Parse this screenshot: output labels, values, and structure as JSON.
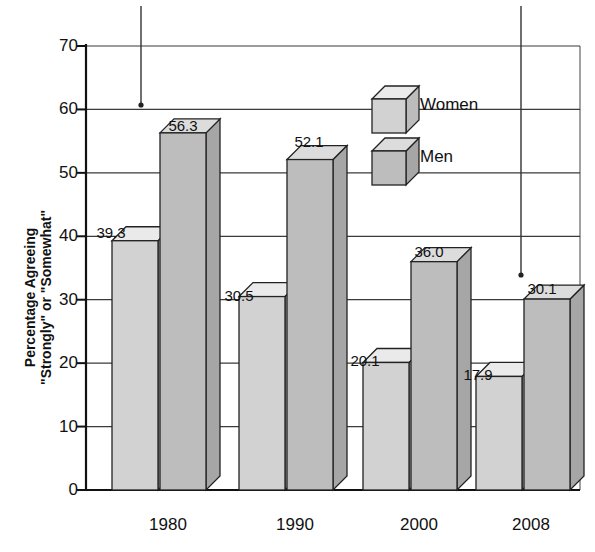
{
  "chart_data": {
    "type": "bar",
    "title": "",
    "subtitle": "",
    "xlabel": "",
    "ylabel": "Percentage Agreeing \"Strongly\" or \"Somewhat\"",
    "ylabel_lines": [
      "Percentage Agreeing",
      "\"Strongly\" or \"Somewhat\""
    ],
    "categories": [
      "1980",
      "1990",
      "2000",
      "2008"
    ],
    "series": [
      {
        "name": "Women",
        "color": "#d2d2d2",
        "values": [
          39.3,
          30.5,
          20.1,
          17.9
        ],
        "labels": [
          "39.3",
          "30.5",
          "20.1",
          "17.9"
        ]
      },
      {
        "name": "Men",
        "color": "#bdbdbd",
        "values": [
          56.3,
          52.1,
          36.0,
          30.1
        ],
        "labels": [
          "56.3",
          "52.1",
          "36.0",
          "30.1"
        ]
      }
    ],
    "ylim": [
      0,
      70
    ],
    "yticks": [
      0,
      10,
      20,
      30,
      40,
      50,
      60,
      70
    ],
    "ytick_labels": [
      "0",
      "10",
      "20",
      "30",
      "40",
      "50",
      "60",
      "70"
    ],
    "grid": true,
    "grid_axis": "y",
    "legend_position": "upper-right-inside",
    "style": "3d-bars",
    "annotations": [
      {
        "name": "leader-line-left",
        "x": 141,
        "y_top": 6,
        "y_dot": 105
      },
      {
        "name": "leader-line-right",
        "x": 521,
        "y_top": 6,
        "y_dot": 275
      }
    ]
  },
  "legend": {
    "entries": [
      {
        "label": "Women",
        "swatch": "cube-light"
      },
      {
        "label": "Men",
        "swatch": "cube-dark"
      }
    ]
  },
  "colors": {
    "women_front": "#d2d2d2",
    "women_top": "#eaeaea",
    "women_side": "#bcbcbc",
    "men_front": "#bdbdbd",
    "men_top": "#dcdcdc",
    "men_side": "#a6a6a6",
    "axis": "#222222",
    "grid": "#3a3a3a",
    "text": "#111111",
    "background": "#ffffff"
  }
}
